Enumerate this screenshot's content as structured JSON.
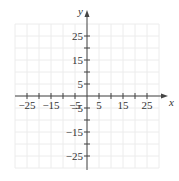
{
  "chart_data": {
    "type": "scatter",
    "title": "",
    "xlabel": "x",
    "ylabel": "y",
    "xlim": [
      -30,
      30
    ],
    "ylim": [
      -30,
      30
    ],
    "grid": true,
    "grid_step": 5,
    "x_ticks": [
      -25,
      -20,
      -15,
      -10,
      -5,
      5,
      10,
      15,
      20,
      25
    ],
    "y_ticks": [
      -25,
      -20,
      -15,
      -10,
      -5,
      5,
      10,
      15,
      20,
      25
    ],
    "x_tick_labels": [
      "-25",
      "-15",
      "-5",
      "5",
      "15",
      "25"
    ],
    "y_tick_labels": [
      "25",
      "15",
      "5",
      "-5",
      "-15",
      "-25"
    ],
    "series": [],
    "legend": null
  },
  "axes": {
    "x_label": "x",
    "y_label": "y",
    "x_labels": [
      {
        "value": -25,
        "text": "−25"
      },
      {
        "value": -15,
        "text": "−15"
      },
      {
        "value": -5,
        "text": "−5"
      },
      {
        "value": 5,
        "text": "5"
      },
      {
        "value": 15,
        "text": "15"
      },
      {
        "value": 25,
        "text": "25"
      }
    ],
    "y_labels": [
      {
        "value": 25,
        "text": "25"
      },
      {
        "value": 15,
        "text": "15"
      },
      {
        "value": 5,
        "text": "5"
      },
      {
        "value": -5,
        "text": "−5"
      },
      {
        "value": -15,
        "text": "−15"
      },
      {
        "value": -25,
        "text": "−25"
      }
    ]
  },
  "colors": {
    "axis": "#444444",
    "grid": "#ececec",
    "text": "#333333"
  }
}
